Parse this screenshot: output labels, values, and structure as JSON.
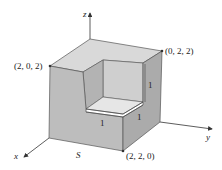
{
  "figure": {
    "axes": {
      "x": "x",
      "y": "y",
      "z": "z"
    },
    "surface_label": "S",
    "points": [
      {
        "id": "p202",
        "label": "(2, 0, 2)"
      },
      {
        "id": "p022",
        "label": "(0, 2, 2)"
      },
      {
        "id": "p220",
        "label": "(2, 2, 0)"
      }
    ],
    "dimensions": [
      {
        "id": "notch-height",
        "label": "1"
      },
      {
        "id": "notch-depth",
        "label": "1"
      },
      {
        "id": "notch-width",
        "label": "1"
      }
    ],
    "colors": {
      "top_face": "#d9d9d9",
      "front_face": "#bdbdbd",
      "right_face": "#aaaaaa",
      "notch_back": "#cfcfcf",
      "notch_left": "#b3b3b3",
      "shelf_top": "#e4e4e4",
      "edge": "#555555",
      "axis": "#333333"
    }
  }
}
